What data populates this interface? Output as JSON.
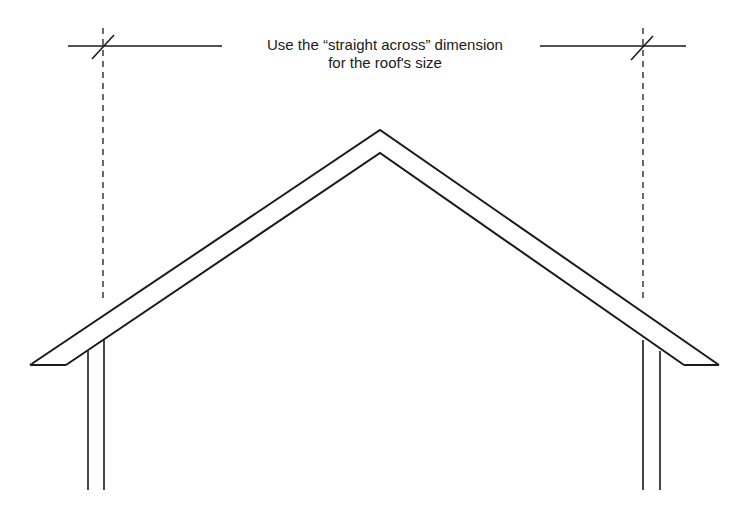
{
  "diagram": {
    "title_line1": "Use the “straight across” dimension",
    "title_line2": "for the roof's size",
    "colors": {
      "stroke": "#1a1a1a",
      "background": "#ffffff"
    },
    "elements": [
      "dimension-line",
      "dimension-tick-left",
      "dimension-tick-right",
      "dashed-extension-left",
      "dashed-extension-right",
      "roof-outer-edge",
      "roof-inner-edge",
      "eave-left",
      "eave-right",
      "wall-left",
      "wall-right"
    ]
  }
}
